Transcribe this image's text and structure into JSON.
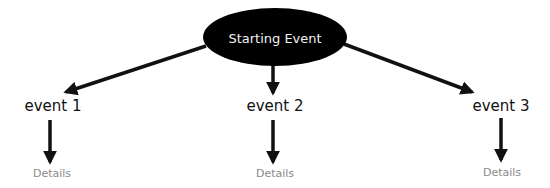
{
  "diagram": {
    "root": {
      "label": "Starting Event",
      "fill": "#000000",
      "text_color": "#f2f2f2"
    },
    "events": [
      {
        "label": "event 1",
        "details": "Details"
      },
      {
        "label": "event 2",
        "details": "Details"
      },
      {
        "label": "event 3",
        "details": "Details"
      }
    ],
    "colors": {
      "arrow": "#111111",
      "event_text": "#111111",
      "details_text": "#8a8a8a",
      "background": "#ffffff"
    }
  }
}
